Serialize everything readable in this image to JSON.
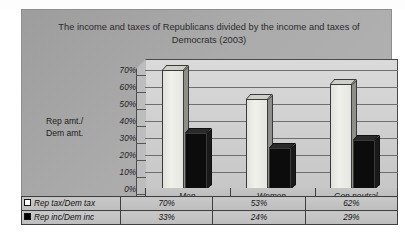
{
  "scan": {
    "ghost_text": "•   •   •"
  },
  "chart_data": {
    "type": "bar",
    "title": "The income and taxes of Republicans divided by the income and taxes of Democrats (2003)",
    "title_line1": "The income and taxes of Republicans divided by the income and",
    "title_line2": "taxes of Democrats (2003)",
    "xlabel": "",
    "ylabel": "Rep amt./ Dem amt.",
    "ylabel_line1": "Rep amt./",
    "ylabel_line2": "Dem amt.",
    "categories": [
      "Men",
      "Women",
      "Gen neutral"
    ],
    "ylim": [
      0,
      70
    ],
    "ytick_labels": [
      "70%",
      "60%",
      "50%",
      "40%",
      "30%",
      "20%",
      "10%",
      "0%"
    ],
    "ytick_values": [
      70,
      60,
      50,
      40,
      30,
      20,
      10,
      0
    ],
    "grid": true,
    "legend_position": "data-table",
    "three_d": true,
    "series": [
      {
        "name": "Rep tax/Dem tax",
        "marker": "hollow-square",
        "color": "#eaeae4",
        "values": [
          70,
          53,
          62
        ],
        "labels": [
          "70%",
          "53%",
          "62%"
        ]
      },
      {
        "name": "Rep inc/Dem inc",
        "marker": "solid-square",
        "color": "#0c0c0c",
        "values": [
          33,
          24,
          29
        ],
        "labels": [
          "33%",
          "24%",
          "29%"
        ]
      }
    ]
  },
  "data_table": {
    "row_headers": [
      "Rep tax/Dem tax",
      "Rep inc/Dem inc"
    ],
    "column_headers": [
      "Men",
      "Women",
      "Gen neutral"
    ],
    "rows": [
      [
        "70%",
        "53%",
        "62%"
      ],
      [
        "33%",
        "24%",
        "29%"
      ]
    ]
  },
  "colors": {
    "panel_background": "#a8a8a8",
    "plot_background": "#d2d2d2",
    "series1": "#eaeae4",
    "series2": "#0c0c0c",
    "gridline": "#6e6e6e",
    "text": "#1c1c1c"
  }
}
